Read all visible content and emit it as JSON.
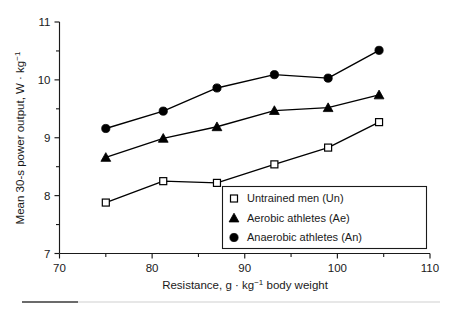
{
  "chart_data": {
    "type": "line",
    "title": "",
    "subtitle": "",
    "xlabel": "Resistance, g · kg⁻¹ body weight",
    "ylabel": "Mean 30-s power output, W · kg⁻¹",
    "xlabel_parts": {
      "before": "Resistance, g · kg",
      "exponent": "−1",
      "after": " body weight"
    },
    "ylabel_parts": {
      "before": "Mean 30-s power output, W · kg",
      "exponent": "−1",
      "after": ""
    },
    "xlim": [
      70,
      110
    ],
    "ylim": [
      7,
      11
    ],
    "xticks": [
      70,
      80,
      90,
      100,
      110
    ],
    "xtick_labels": [
      "70",
      "80",
      "90",
      "100",
      "110"
    ],
    "xminor_ticks": [
      75,
      85,
      95,
      105
    ],
    "yticks": [
      7,
      8,
      9,
      10,
      11
    ],
    "ytick_labels": [
      "7",
      "8",
      "9",
      "10",
      "11"
    ],
    "yminor_ticks": [
      7.5,
      8.5,
      9.5,
      10.5
    ],
    "grid": false,
    "legend_position": "lower-right",
    "x": [
      75.0,
      81.2,
      87.0,
      93.2,
      99.0,
      104.5
    ],
    "series": [
      {
        "name": "Untrained men (Un)",
        "short": "Un",
        "marker": "open-square",
        "values": [
          7.88,
          8.25,
          8.22,
          8.54,
          8.83,
          9.27
        ]
      },
      {
        "name": "Aerobic athletes (Ae)",
        "short": "Ae",
        "marker": "filled-triangle",
        "values": [
          8.66,
          8.99,
          9.19,
          9.47,
          9.52,
          9.74
        ]
      },
      {
        "name": "Anaerobic athletes (An)",
        "short": "An",
        "marker": "filled-circle",
        "values": [
          9.16,
          9.46,
          9.86,
          10.09,
          10.03,
          10.51
        ]
      }
    ],
    "colors": {
      "axis": "#1a1a1a",
      "line": "#000000",
      "marker_fill": "#000000",
      "marker_open_fill": "#ffffff",
      "background": "#ffffff"
    }
  },
  "legend": {
    "items": [
      {
        "marker": "open-square",
        "label": "Untrained men (Un)"
      },
      {
        "marker": "filled-triangle",
        "label": "Aerobic athletes (Ae)"
      },
      {
        "marker": "filled-circle",
        "label": "Anaerobic athletes (An)"
      }
    ]
  }
}
